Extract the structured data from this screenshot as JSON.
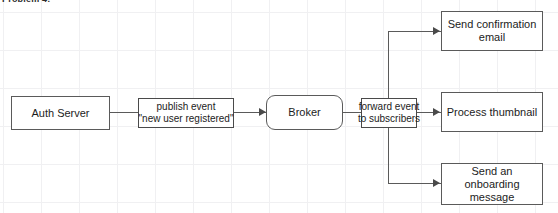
{
  "page": {
    "cropped_heading": "Problem 4:",
    "background": "#ffffff",
    "grid_color": "#f0f0f2",
    "stroke_color": "#5a5a5a",
    "text_color": "#1c1c1c"
  },
  "diagram": {
    "type": "flow-diagram",
    "nodes": [
      {
        "id": "auth-server",
        "label": "Auth Server",
        "shape": "rectangle"
      },
      {
        "id": "broker",
        "label": "Broker",
        "shape": "rounded-rectangle"
      },
      {
        "id": "send-confirmation-email",
        "label_line1": "Send confirmation",
        "label_line2": "email",
        "shape": "rectangle"
      },
      {
        "id": "process-thumbnail",
        "label_line1": "Process thumbnail",
        "label_line2": "",
        "shape": "rectangle"
      },
      {
        "id": "send-onboarding-message",
        "label_line1": "Send an onboarding",
        "label_line2": "message",
        "shape": "rectangle"
      }
    ],
    "edge_labels": [
      {
        "id": "publish-event",
        "line1": "publish event",
        "line2": "\"new user registered\""
      },
      {
        "id": "forward-event",
        "line1": "forward event",
        "line2": "to subscribers"
      }
    ],
    "edges": [
      {
        "from": "auth-server",
        "to": "broker",
        "label": "publish-event"
      },
      {
        "from": "broker",
        "to": "send-confirmation-email",
        "label": "forward-event"
      },
      {
        "from": "broker",
        "to": "process-thumbnail",
        "label": "forward-event"
      },
      {
        "from": "broker",
        "to": "send-onboarding-message",
        "label": "forward-event"
      }
    ]
  }
}
